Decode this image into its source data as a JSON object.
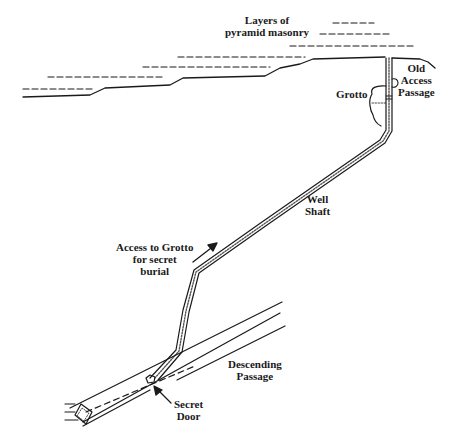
{
  "diagram": {
    "colors": {
      "ink": "#1a1a1a",
      "background": "#ffffff"
    },
    "labels": {
      "masonry": [
        "Layers of",
        "pyramid masonry"
      ],
      "old_access": [
        "Old",
        "Access",
        "Passage"
      ],
      "grotto": [
        "Grotto"
      ],
      "well_shaft": [
        "Well",
        "Shaft"
      ],
      "access_grotto": [
        "Access to Grotto",
        "for secret",
        "burial"
      ],
      "descending": [
        "Descending",
        "Passage"
      ],
      "secret_door": [
        "Secret",
        "Door"
      ]
    }
  }
}
